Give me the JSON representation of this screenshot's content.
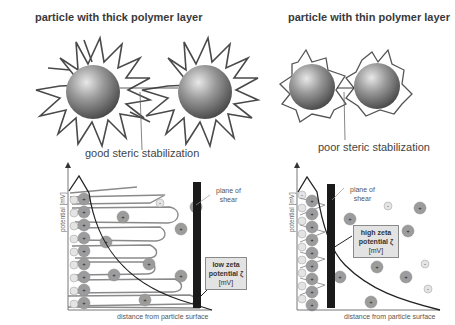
{
  "panels": {
    "thick": {
      "title": "particle with thick polymer layer",
      "caption": "good steric stabilization"
    },
    "thin": {
      "title": "particle with thin polymer layer",
      "caption": "poor steric stabilization"
    }
  },
  "graphs": {
    "left": {
      "y_axis_label": "potential [mV]",
      "x_axis_label": "distance from particle surface",
      "shear_label_line1": "plane of",
      "shear_label_line2": "shear",
      "zeta_line1": "low zeta",
      "zeta_line2": "potential ζ",
      "zeta_unit": "[mV]"
    },
    "right": {
      "y_axis_label": "potential [mV]",
      "x_axis_label": "distance from particle surface",
      "shear_label_line1": "plane of",
      "shear_label_line2": "shear",
      "zeta_line1": "high zeta",
      "zeta_line2": "potential ζ",
      "zeta_unit": "[mV]"
    }
  },
  "colors": {
    "particle_dark": "#5a5a5a",
    "particle_light": "#d8d8d8",
    "polymer": "#555555",
    "ion_positive": "#9a9a9a",
    "ion_negative": "#e6e6e6",
    "shear_plane": "#1a1a1a",
    "zeta_box": "#e3e3e3"
  }
}
